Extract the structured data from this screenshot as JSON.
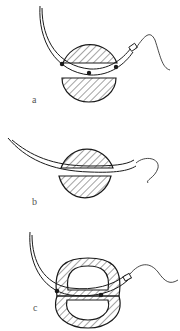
{
  "figure": {
    "panels": [
      {
        "id": "a",
        "label": "a",
        "description": "Curved needle with suture passing above split tissue; three knots/contact points"
      },
      {
        "id": "b",
        "label": "b",
        "description": "Needle passing horizontally through center of tissue cross-section"
      },
      {
        "id": "c",
        "label": "c",
        "description": "Needle passing through ring-shaped tissue (hollow lumen) with two contact points"
      }
    ],
    "colors": {
      "stroke": "#1a1a1a",
      "background": "#ffffff",
      "hatch": "#333333"
    }
  }
}
